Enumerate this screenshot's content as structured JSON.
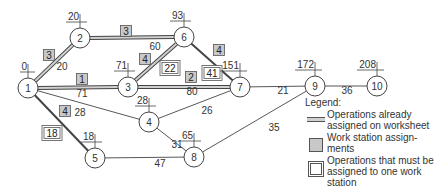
{
  "nodes": [
    {
      "id": "1",
      "label": "1",
      "time": "0",
      "x": 28,
      "y": 88
    },
    {
      "id": "2",
      "label": "2",
      "time": "20",
      "x": 80,
      "y": 38
    },
    {
      "id": "3",
      "label": "3",
      "time": "71",
      "x": 128,
      "y": 87
    },
    {
      "id": "4",
      "label": "4",
      "time": "28",
      "x": 149,
      "y": 122
    },
    {
      "id": "5",
      "label": "5",
      "time": "18",
      "x": 95,
      "y": 158
    },
    {
      "id": "6",
      "label": "6",
      "time": "93",
      "x": 184,
      "y": 37
    },
    {
      "id": "7",
      "label": "7",
      "time": "151",
      "x": 240,
      "y": 87
    },
    {
      "id": "8",
      "label": "8",
      "time": "65",
      "x": 194,
      "y": 157
    },
    {
      "id": "9",
      "label": "9",
      "time": "172",
      "x": 315,
      "y": 86
    },
    {
      "id": "10",
      "label": "10",
      "time": "208",
      "x": 377,
      "y": 86
    }
  ],
  "edges": [
    {
      "from": "1",
      "to": "2",
      "weight": "20",
      "style": "double"
    },
    {
      "from": "2",
      "to": "6",
      "weight": "60",
      "style": "double"
    },
    {
      "from": "1",
      "to": "3",
      "weight": "71",
      "style": "double"
    },
    {
      "from": "3",
      "to": "6",
      "weight": "",
      "style": "double"
    },
    {
      "from": "3",
      "to": "7",
      "weight": "80",
      "style": "double"
    },
    {
      "from": "6",
      "to": "7",
      "weight": "",
      "style": "bold"
    },
    {
      "from": "1",
      "to": "4",
      "weight": "28",
      "style": "single"
    },
    {
      "from": "1",
      "to": "5",
      "weight": "",
      "style": "bold"
    },
    {
      "from": "4",
      "to": "7",
      "weight": "26",
      "style": "single"
    },
    {
      "from": "4",
      "to": "8",
      "weight": "31",
      "style": "single"
    },
    {
      "from": "5",
      "to": "8",
      "weight": "47",
      "style": "single"
    },
    {
      "from": "7",
      "to": "9",
      "weight": "21",
      "style": "single"
    },
    {
      "from": "8",
      "to": "9",
      "weight": "35",
      "style": "single"
    },
    {
      "from": "9",
      "to": "10",
      "weight": "36",
      "style": "single"
    }
  ],
  "workstation_boxes": [
    {
      "label": "3",
      "type": "gray",
      "x": 49,
      "y": 55
    },
    {
      "label": "3",
      "type": "gray",
      "x": 126,
      "y": 31
    },
    {
      "label": "1",
      "type": "gray",
      "x": 82,
      "y": 79
    },
    {
      "label": "4",
      "type": "gray",
      "x": 145,
      "y": 59
    },
    {
      "label": "2",
      "type": "gray",
      "x": 191,
      "y": 77
    },
    {
      "label": "4",
      "type": "gray",
      "x": 219,
      "y": 50
    },
    {
      "label": "4",
      "type": "gray",
      "x": 65,
      "y": 111
    },
    {
      "label": "22",
      "type": "double",
      "x": 170,
      "y": 68
    },
    {
      "label": "41",
      "type": "double",
      "x": 212,
      "y": 73
    },
    {
      "label": "18",
      "type": "double",
      "x": 52,
      "y": 133
    }
  ],
  "edge_labels": [
    {
      "text": "20",
      "x": 62,
      "y": 70
    },
    {
      "text": "60",
      "x": 155,
      "y": 50
    },
    {
      "text": "71",
      "x": 82,
      "y": 97
    },
    {
      "text": "80",
      "x": 192,
      "y": 95
    },
    {
      "text": "28",
      "x": 80,
      "y": 116
    },
    {
      "text": "26",
      "x": 207,
      "y": 114
    },
    {
      "text": "31",
      "x": 177,
      "y": 148
    },
    {
      "text": "47",
      "x": 160,
      "y": 167
    },
    {
      "text": "21",
      "x": 283,
      "y": 94
    },
    {
      "text": "35",
      "x": 274,
      "y": 131
    },
    {
      "text": "36",
      "x": 347,
      "y": 94
    }
  ],
  "legend": {
    "title": "Legend:",
    "items": [
      {
        "symbol": "double-line",
        "text": "Operations already assigned on worksheet"
      },
      {
        "symbol": "gray-box",
        "text": "Work station assign-ments"
      },
      {
        "symbol": "double-box",
        "text": "Operations that must be assigned to one work station"
      }
    ]
  },
  "colors": {
    "line": "#444444",
    "double_fill": "#d0d0d0",
    "gray_box": "#c8c8c8",
    "background": "#ffffff"
  }
}
